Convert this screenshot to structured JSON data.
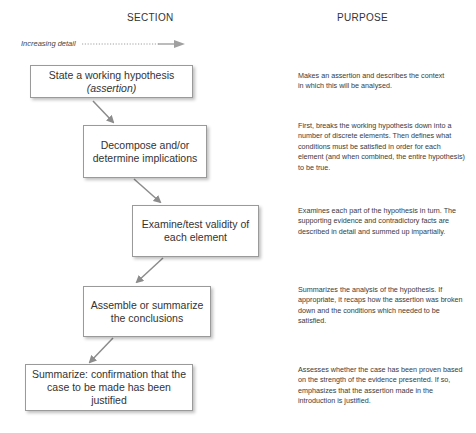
{
  "headers": {
    "section": "SECTION",
    "purpose": "PURPOSE"
  },
  "detail_indicator": {
    "label": "Increasing detail",
    "arrow_color": "#9a9a9a"
  },
  "steps": [
    {
      "section": "State a working hypothesis",
      "section_sub": "(assertion)",
      "purpose": "Makes an assertion and describes the context in which this will be analysed."
    },
    {
      "section": "Decompose and/or determine implications",
      "section_sub": "",
      "purpose": "First, breaks the working hypothesis down into a number of discrete elements. Then defines what conditions must be satisfied in order for each element (and when combined, the entire hypothesis) to be true."
    },
    {
      "section": "Examine/test validity of each element",
      "section_sub": "",
      "purpose": "Examines each part of the hypothesis in turn. The supporting evidence and contradictory facts are described in detail and summed up impartially."
    },
    {
      "section": "Assemble or summarize the conclusions",
      "section_sub": "",
      "purpose": "Summarizes the analysis of the hypothesis. If appropriate, it recaps how the assertion was broken down and the conditions which needed to be satisfied."
    },
    {
      "section": "Summarize: confirmation that the case to be made has been justified",
      "section_sub": "",
      "purpose": "Assesses whether the case has been proven based on the strength of the evidence presented. If so, emphasizes that the assertion made in the introduction is justified."
    }
  ],
  "colors": {
    "arrow": "#8c8c8c",
    "box_border": "#9a9a9a",
    "text": "#333333"
  }
}
